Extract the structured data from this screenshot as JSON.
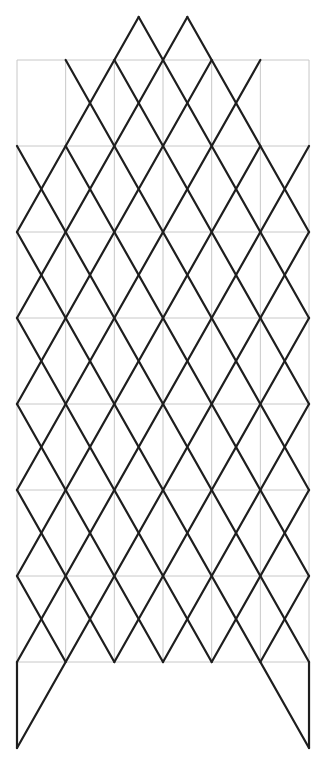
{
  "diagram": {
    "origin_px": [
      17,
      60
    ],
    "unit_px": [
      48.67,
      86
    ],
    "grid": {
      "cols": 6,
      "rows": 7,
      "color": "#c8c8c8"
    },
    "lattice_color": "#1e1e1e",
    "lines": [
      [
        [
          3.5,
          -0.5
        ],
        [
          6,
          2
        ]
      ],
      [
        [
          2.5,
          -0.5
        ],
        [
          6,
          3
        ]
      ],
      [
        [
          2,
          0
        ],
        [
          6,
          4
        ]
      ],
      [
        [
          1,
          0
        ],
        [
          6,
          5
        ]
      ],
      [
        [
          1,
          1
        ],
        [
          6,
          6
        ]
      ],
      [
        [
          0,
          1
        ],
        [
          6,
          7
        ]
      ],
      [
        [
          0,
          2
        ],
        [
          6,
          8
        ]
      ],
      [
        [
          0,
          3
        ],
        [
          4,
          7
        ]
      ],
      [
        [
          0,
          4
        ],
        [
          3,
          7
        ]
      ],
      [
        [
          0,
          5
        ],
        [
          2,
          7
        ]
      ],
      [
        [
          0,
          6
        ],
        [
          1,
          7
        ]
      ],
      [
        [
          2.5,
          -0.5
        ],
        [
          0,
          2
        ]
      ],
      [
        [
          3.5,
          -0.5
        ],
        [
          0,
          3
        ]
      ],
      [
        [
          4,
          0
        ],
        [
          0,
          4
        ]
      ],
      [
        [
          5,
          0
        ],
        [
          0,
          5
        ]
      ],
      [
        [
          5,
          1
        ],
        [
          0,
          6
        ]
      ],
      [
        [
          6,
          1
        ],
        [
          0,
          7
        ]
      ],
      [
        [
          6,
          2
        ],
        [
          0,
          8
        ]
      ],
      [
        [
          6,
          3
        ],
        [
          2,
          7
        ]
      ],
      [
        [
          6,
          4
        ],
        [
          3,
          7
        ]
      ],
      [
        [
          6,
          5
        ],
        [
          4,
          7
        ]
      ],
      [
        [
          6,
          6
        ],
        [
          5,
          7
        ]
      ],
      [
        [
          0,
          7
        ],
        [
          0,
          8
        ]
      ],
      [
        [
          6,
          7
        ],
        [
          6,
          8
        ]
      ]
    ]
  }
}
